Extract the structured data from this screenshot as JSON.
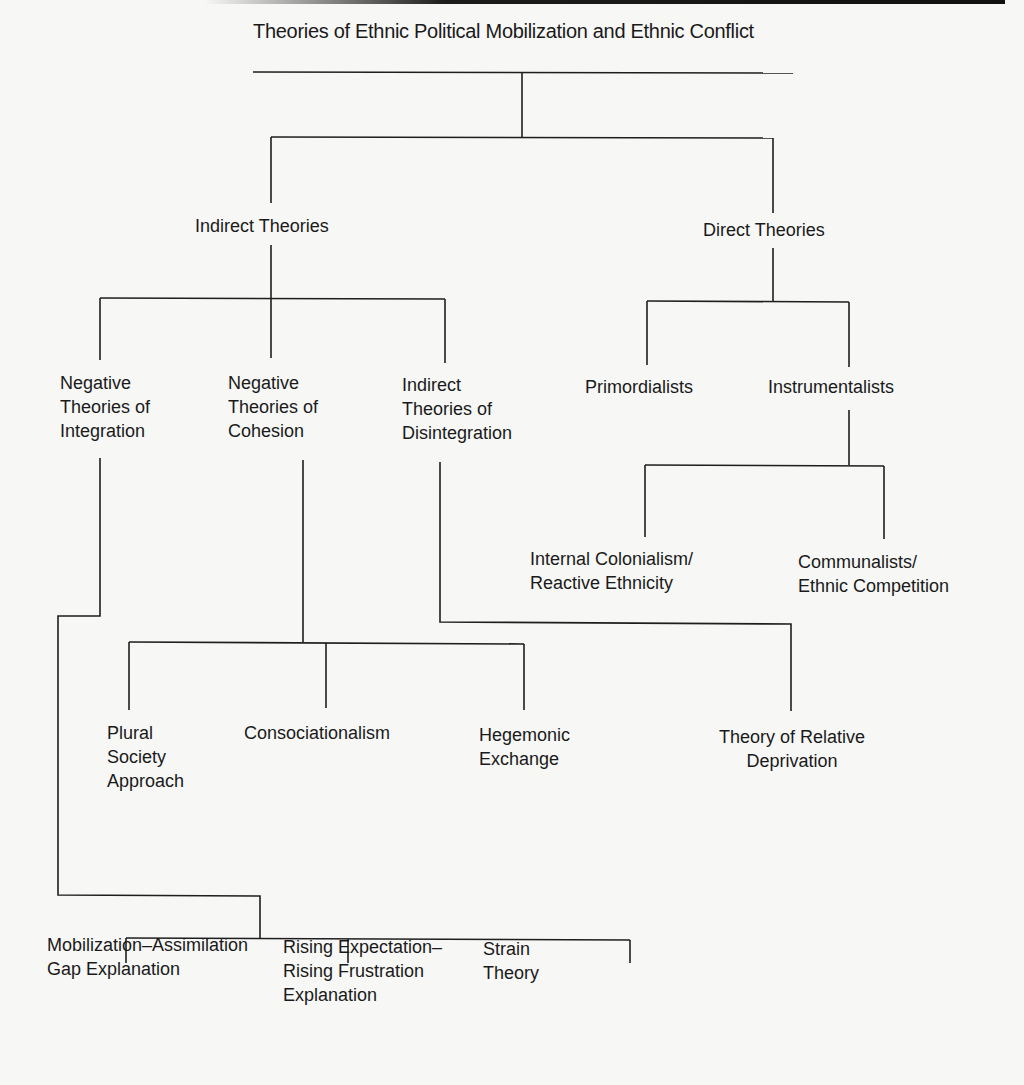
{
  "diagram": {
    "title": "Theories of Ethnic Political Mobilization and Ethnic Conflict",
    "level1": {
      "indirect": "Indirect Theories",
      "direct": "Direct Theories"
    },
    "indirect_children": {
      "neg_integration": "Negative\nTheories of\nIntegration",
      "neg_cohesion": "Negative\nTheories of\nCohesion",
      "indirect_disintegration": "Indirect\nTheories of\nDisintegration"
    },
    "direct_children": {
      "primordialists": "Primordialists",
      "instrumentalists": "Instrumentalists"
    },
    "instrumentalist_children": {
      "internal_colonialism": "Internal Colonialism/\nReactive Ethnicity",
      "communalists": "Communalists/\nEthnic Competition"
    },
    "cohesion_children": {
      "plural_society": "Plural\nSociety\nApproach",
      "consociationalism": "Consociationalism",
      "hegemonic_exchange": "Hegemonic\nExchange"
    },
    "disintegration_children": {
      "relative_deprivation": "Theory of Relative\nDeprivation"
    },
    "integration_children": {
      "mobilization_assimilation": "Mobilization–Assimilation\nGap Explanation",
      "rising_expectation": "Rising Expectation–\nRising Frustration\nExplanation",
      "strain_theory": "Strain\nTheory"
    }
  }
}
